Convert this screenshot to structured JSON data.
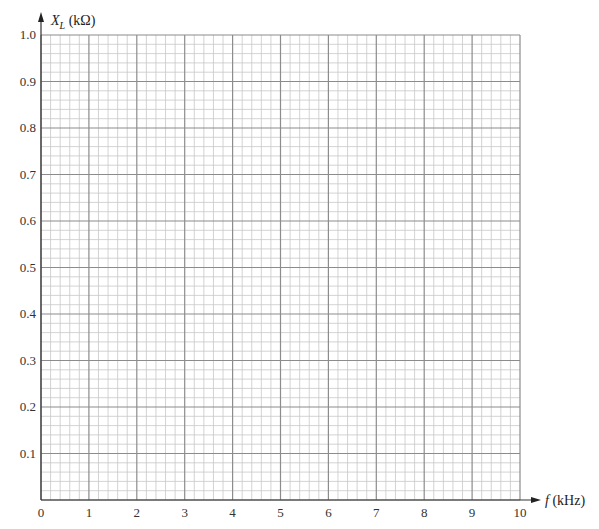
{
  "chart_data": {
    "type": "line",
    "title": "",
    "xlabel": "f (kHz)",
    "ylabel": "X_L (kΩ)",
    "xlim": [
      0,
      10
    ],
    "ylim": [
      0,
      1.0
    ],
    "x_ticks": [
      "0",
      "1",
      "2",
      "3",
      "4",
      "5",
      "6",
      "7",
      "8",
      "9",
      "10"
    ],
    "y_ticks": [
      "0.1",
      "0.2",
      "0.3",
      "0.4",
      "0.5",
      "0.6",
      "0.7",
      "0.8",
      "0.9",
      "1.0"
    ],
    "x_minor_divisions": 5,
    "y_minor_divisions": 5,
    "grid": true,
    "series": [],
    "legend": null
  },
  "axes": {
    "y_title_main": "X",
    "y_title_sub": "L",
    "y_title_unit": " (kΩ)",
    "x_title_main": "f",
    "x_title_unit": " (kHz)"
  },
  "colors": {
    "major_grid": "#8c8c8c",
    "minor_grid": "#c8c8c8",
    "axis": "#333333"
  }
}
